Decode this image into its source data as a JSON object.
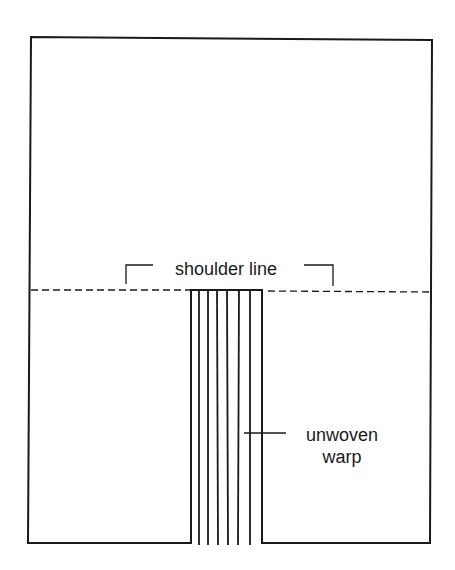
{
  "diagram": {
    "type": "garment-weaving-plan",
    "stroke_color": "#1a1a1a",
    "background": "#ffffff",
    "labels": {
      "shoulder_line": "shoulder line",
      "unwoven_line1": "unwoven",
      "unwoven_line2": "warp"
    },
    "elements": {
      "outer_panel": "rectangular woven panel with neck opening slot at bottom center",
      "shoulder_line": "dashed horizontal line across the panel",
      "warp_threads": 8
    }
  }
}
